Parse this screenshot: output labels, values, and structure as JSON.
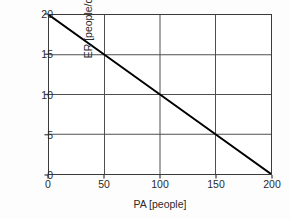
{
  "chart_data": {
    "type": "line",
    "title": "",
    "subtitle": "",
    "xlabel": "PA [people]",
    "ylabel": "ER [people/day]",
    "xlim": [
      0,
      200
    ],
    "ylim": [
      0,
      20
    ],
    "xticks": [
      0,
      50,
      100,
      150,
      200
    ],
    "yticks": [
      0,
      5,
      10,
      15,
      20
    ],
    "xtick_labels": [
      "0",
      "50",
      "100",
      "150",
      "200"
    ],
    "ytick_labels": [
      "0",
      "5",
      "10",
      "15",
      "20"
    ],
    "grid": true,
    "grid_color": "#4d4d4d",
    "legend": null,
    "legend_position": "none",
    "annotations": [],
    "series": [
      {
        "name": "ER vs PA",
        "color": "#000000",
        "line_width": 2,
        "style": "solid",
        "markers": false,
        "x": [
          0,
          50,
          100,
          150,
          200
        ],
        "y": [
          20,
          15,
          10,
          5,
          0
        ]
      }
    ]
  },
  "figure": {
    "background_color": "#fdfdfd",
    "plot_background_color": "#ffffff",
    "frame_color": "#3a3a3a"
  }
}
